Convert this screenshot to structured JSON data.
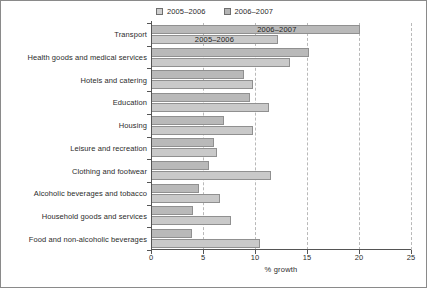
{
  "chart_data": {
    "type": "bar",
    "orientation": "horizontal",
    "title": "",
    "xlabel": "% growth",
    "ylabel": "",
    "xlim": [
      0,
      25
    ],
    "xticks": [
      0,
      5,
      10,
      15,
      20,
      25
    ],
    "xtick_labels": [
      "0",
      "5",
      "10",
      "15",
      "20",
      "25"
    ],
    "grid": "vertical-dashed",
    "legend_position": "top-center",
    "categories": [
      "Transport",
      "Health goods and medical services",
      "Hotels and catering",
      "Education",
      "Housing",
      "Leisure and recreation",
      "Clothing and footwear",
      "Alcoholic beverages and tobacco",
      "Household goods and services",
      "Food and non-alcoholic beverages"
    ],
    "series": [
      {
        "name": "2006–2007",
        "color": "#b9b9b9",
        "values": [
          20.1,
          15.2,
          8.9,
          9.5,
          7.0,
          6.1,
          5.6,
          4.6,
          4.0,
          3.9
        ]
      },
      {
        "name": "2005–2006",
        "color": "#c9c9c9",
        "values": [
          12.2,
          13.4,
          9.8,
          11.3,
          9.8,
          6.3,
          11.5,
          6.6,
          7.7,
          10.5
        ]
      }
    ],
    "annotations": [
      {
        "text": "2005–2006",
        "x": 6.1,
        "category_index": 0,
        "series_index": 1
      },
      {
        "text": "2006–2007",
        "x": 12.1,
        "category_index": 0,
        "series_index": 0
      }
    ]
  },
  "legend": {
    "entries": [
      {
        "label": "2005–2006",
        "swatch": "legend-swatch-2005-2006"
      },
      {
        "label": "2006–2007",
        "swatch": "legend-swatch-2006-2007"
      }
    ]
  }
}
